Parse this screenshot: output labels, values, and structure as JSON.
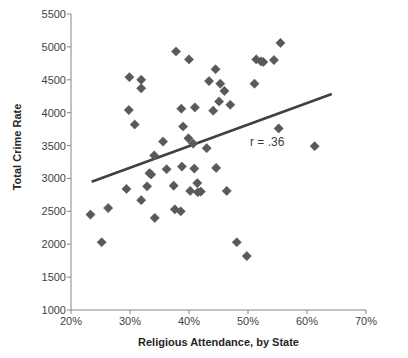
{
  "chart_data": {
    "type": "scatter",
    "title": "",
    "xlabel": "Religious Attendance, by State",
    "ylabel": "Total Crime Rate",
    "xlim": [
      20,
      70
    ],
    "ylim": [
      1000,
      5500
    ],
    "x_ticks": [
      "20%",
      "30%",
      "40%",
      "50%",
      "60%",
      "70%"
    ],
    "x_tick_values": [
      20,
      30,
      40,
      50,
      60,
      70
    ],
    "y_ticks": [
      "1000",
      "1500",
      "2000",
      "2500",
      "3000",
      "3500",
      "4000",
      "4500",
      "5000",
      "5500"
    ],
    "y_tick_values": [
      1000,
      1500,
      2000,
      2500,
      3000,
      3500,
      4000,
      4500,
      5000,
      5500
    ],
    "grid": false,
    "legend": false,
    "annotations": [
      {
        "text": "r = .36",
        "x": 50.7,
        "y": 3350
      }
    ],
    "marker": {
      "shape": "diamond",
      "color": "#595959",
      "size": 6
    },
    "trendline": {
      "color": "#404040",
      "width": 2.6,
      "x_start": 23.5,
      "y_start": 2950,
      "x_end": 64.2,
      "y_end": 4285
    },
    "points": [
      {
        "x": 23.3,
        "y": 2450
      },
      {
        "x": 25.2,
        "y": 2030
      },
      {
        "x": 26.3,
        "y": 2550
      },
      {
        "x": 29.4,
        "y": 2840
      },
      {
        "x": 29.9,
        "y": 4540
      },
      {
        "x": 29.8,
        "y": 4040
      },
      {
        "x": 31.9,
        "y": 2670
      },
      {
        "x": 31.9,
        "y": 4500
      },
      {
        "x": 31.9,
        "y": 4370
      },
      {
        "x": 30.8,
        "y": 3820
      },
      {
        "x": 32.9,
        "y": 2880
      },
      {
        "x": 34.2,
        "y": 2400
      },
      {
        "x": 33.3,
        "y": 3080
      },
      {
        "x": 33.6,
        "y": 3060
      },
      {
        "x": 34.1,
        "y": 3350
      },
      {
        "x": 35.6,
        "y": 3560
      },
      {
        "x": 37.6,
        "y": 2530
      },
      {
        "x": 38.6,
        "y": 2500
      },
      {
        "x": 37.8,
        "y": 4930
      },
      {
        "x": 40.0,
        "y": 4810
      },
      {
        "x": 38.7,
        "y": 4060
      },
      {
        "x": 41.0,
        "y": 4080
      },
      {
        "x": 39.0,
        "y": 3790
      },
      {
        "x": 39.9,
        "y": 3610
      },
      {
        "x": 40.7,
        "y": 3530
      },
      {
        "x": 38.8,
        "y": 3180
      },
      {
        "x": 40.9,
        "y": 3150
      },
      {
        "x": 36.2,
        "y": 3140
      },
      {
        "x": 37.4,
        "y": 2890
      },
      {
        "x": 41.4,
        "y": 2930
      },
      {
        "x": 40.2,
        "y": 2810
      },
      {
        "x": 41.5,
        "y": 2790
      },
      {
        "x": 42.0,
        "y": 2800
      },
      {
        "x": 43.0,
        "y": 3460
      },
      {
        "x": 44.1,
        "y": 4030
      },
      {
        "x": 43.4,
        "y": 4480
      },
      {
        "x": 44.5,
        "y": 4660
      },
      {
        "x": 45.3,
        "y": 4440
      },
      {
        "x": 46.0,
        "y": 4330
      },
      {
        "x": 45.1,
        "y": 4170
      },
      {
        "x": 47.0,
        "y": 4120
      },
      {
        "x": 44.6,
        "y": 3160
      },
      {
        "x": 46.4,
        "y": 2810
      },
      {
        "x": 48.1,
        "y": 2030
      },
      {
        "x": 49.8,
        "y": 1820
      },
      {
        "x": 51.4,
        "y": 4810
      },
      {
        "x": 52.2,
        "y": 4780
      },
      {
        "x": 52.6,
        "y": 4770
      },
      {
        "x": 54.4,
        "y": 4800
      },
      {
        "x": 55.5,
        "y": 5060
      },
      {
        "x": 51.1,
        "y": 4440
      },
      {
        "x": 55.2,
        "y": 3760
      },
      {
        "x": 61.3,
        "y": 3490
      }
    ]
  }
}
